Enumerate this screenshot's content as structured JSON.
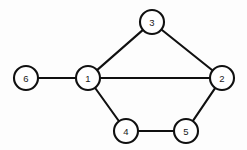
{
  "figure": {
    "kind": "undirected-graph-diagram",
    "width": 247,
    "height": 150,
    "background_color": "#fdfdfd",
    "node_fill_color": "#ffffff",
    "node_stroke_color": "#101010",
    "edge_color": "#101010",
    "label_color": "#1a1a1a",
    "node_radius": 12,
    "edge_width": 2.1
  },
  "nodes": [
    {
      "id": "6",
      "label": "6",
      "x": 26,
      "y": 78
    },
    {
      "id": "1",
      "label": "1",
      "x": 88,
      "y": 78
    },
    {
      "id": "3",
      "label": "3",
      "x": 152,
      "y": 22
    },
    {
      "id": "2",
      "label": "2",
      "x": 222,
      "y": 78
    },
    {
      "id": "4",
      "label": "4",
      "x": 126,
      "y": 131
    },
    {
      "id": "5",
      "label": "5",
      "x": 186,
      "y": 131
    }
  ],
  "edges": [
    {
      "id": "edge-6-1",
      "source": "6",
      "target": "1"
    },
    {
      "id": "edge-1-3",
      "source": "1",
      "target": "3"
    },
    {
      "id": "edge-3-2",
      "source": "3",
      "target": "2"
    },
    {
      "id": "edge-1-2",
      "source": "1",
      "target": "2"
    },
    {
      "id": "edge-1-4",
      "source": "1",
      "target": "4"
    },
    {
      "id": "edge-4-5",
      "source": "4",
      "target": "5"
    },
    {
      "id": "edge-5-2",
      "source": "5",
      "target": "2"
    }
  ]
}
